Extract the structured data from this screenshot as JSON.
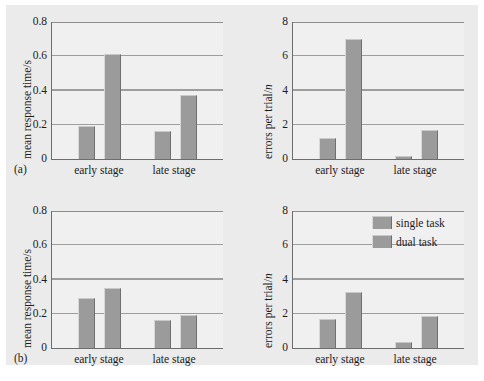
{
  "figure": {
    "panel_labels": [
      "(a)",
      "(b)"
    ],
    "legend": {
      "entries": [
        "single task",
        "dual task"
      ],
      "swatch_color": "#9b9b9b"
    }
  },
  "chart_data": [
    {
      "id": "panel-a-rt",
      "type": "bar",
      "panel": "(a)",
      "title": "",
      "xlabel": "",
      "ylabel": "mean response time/s",
      "categories": [
        "early stage",
        "late stage"
      ],
      "series": [
        {
          "name": "single task",
          "values": [
            0.195,
            0.165
          ]
        },
        {
          "name": "dual task",
          "values": [
            0.615,
            0.375
          ]
        }
      ],
      "ylim": [
        0,
        0.8
      ],
      "yticks": [
        "0",
        "0.2",
        "0.4",
        "0.6",
        "0.8"
      ],
      "ytick_values": [
        0,
        0.2,
        0.4,
        0.6,
        0.8
      ],
      "grid": true,
      "legend_position": "none"
    },
    {
      "id": "panel-a-errors",
      "type": "bar",
      "panel": "(a)",
      "title": "",
      "xlabel": "",
      "ylabel": "errors per trial/n",
      "categories": [
        "early stage",
        "late stage"
      ],
      "series": [
        {
          "name": "single task",
          "values": [
            1.2,
            0.15
          ]
        },
        {
          "name": "dual task",
          "values": [
            7.0,
            1.7
          ]
        }
      ],
      "ylim": [
        0,
        8
      ],
      "yticks": [
        "0",
        "2",
        "4",
        "6",
        "8"
      ],
      "ytick_values": [
        0,
        2,
        4,
        6,
        8
      ],
      "grid": true,
      "legend_position": "none"
    },
    {
      "id": "panel-b-rt",
      "type": "bar",
      "panel": "(b)",
      "title": "",
      "xlabel": "",
      "ylabel": "mean response time/s",
      "categories": [
        "early stage",
        "late stage"
      ],
      "series": [
        {
          "name": "single task",
          "values": [
            0.29,
            0.165
          ]
        },
        {
          "name": "dual task",
          "values": [
            0.35,
            0.19
          ]
        }
      ],
      "ylim": [
        0,
        0.8
      ],
      "yticks": [
        "0",
        "0.2",
        "0.4",
        "0.6",
        "0.8"
      ],
      "ytick_values": [
        0,
        0.2,
        0.4,
        0.6,
        0.8
      ],
      "grid": true,
      "legend_position": "none"
    },
    {
      "id": "panel-b-errors",
      "type": "bar",
      "panel": "(b)",
      "title": "",
      "xlabel": "",
      "ylabel": "errors per trial/n",
      "categories": [
        "early stage",
        "late stage"
      ],
      "series": [
        {
          "name": "single task",
          "values": [
            1.7,
            0.35
          ]
        },
        {
          "name": "dual task",
          "values": [
            3.3,
            1.85
          ]
        }
      ],
      "ylim": [
        0,
        8
      ],
      "yticks": [
        "0",
        "2",
        "4",
        "6",
        "8"
      ],
      "ytick_values": [
        0,
        2,
        4,
        6,
        8
      ],
      "grid": true,
      "legend_position": "upper right"
    }
  ]
}
